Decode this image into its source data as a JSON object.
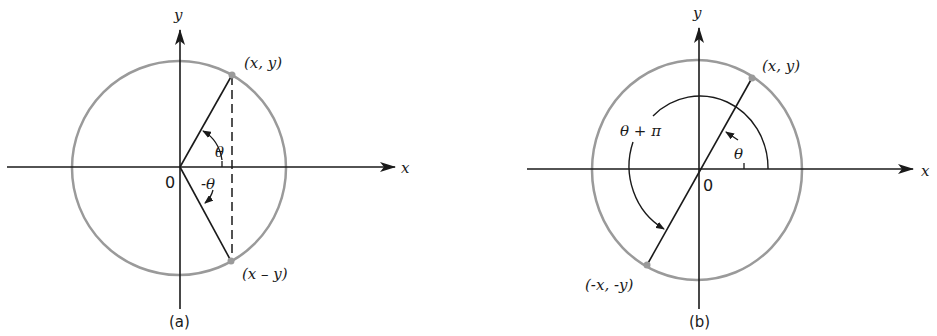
{
  "figures": [
    {
      "id": "a",
      "caption": "(a)",
      "axis_x_label": "x",
      "axis_y_label": "y",
      "origin_label": "0",
      "point_upper_label": "(x, y)",
      "point_lower_label": "(x – y)",
      "angle_upper_label": "θ",
      "angle_lower_label": "-θ"
    },
    {
      "id": "b",
      "caption": "(b)",
      "axis_x_label": "x",
      "axis_y_label": "y",
      "origin_label": "0",
      "point_upper_label": "(x, y)",
      "point_lower_label": "(-x, -y)",
      "angle_small_label": "θ",
      "angle_large_label": "θ + π"
    }
  ],
  "colors": {
    "circle": "#9a9a9a",
    "ink": "#1a1a1a"
  }
}
